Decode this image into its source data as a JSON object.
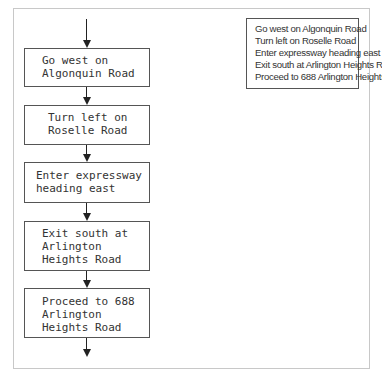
{
  "flowchart": {
    "steps": [
      {
        "lines": [
          "Go west on",
          "Algonquin Road"
        ]
      },
      {
        "lines": [
          "Turn left on",
          "Roselle Road"
        ]
      },
      {
        "lines": [
          "Enter expressway",
          "heading east"
        ]
      },
      {
        "lines": [
          "Exit south at",
          "Arlington",
          "Heights Road"
        ]
      },
      {
        "lines": [
          "Proceed to 688",
          "Arlington",
          "Heights Road"
        ]
      }
    ]
  },
  "summary": {
    "lines": [
      "Go west on Algonquin Road",
      "Turn left on Roselle Road",
      "Enter expressway heading east",
      "Exit south at Arlington Heights Road",
      "Proceed to 688 Arlington Heights Road"
    ]
  }
}
